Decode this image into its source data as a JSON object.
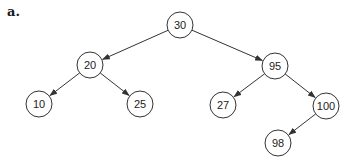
{
  "figure_label": "a.",
  "tree": {
    "type": "binary-search-tree",
    "nodes": [
      {
        "id": "n30",
        "value": "30",
        "x": 180,
        "y": 25
      },
      {
        "id": "n20",
        "value": "20",
        "x": 90,
        "y": 65
      },
      {
        "id": "n95",
        "value": "95",
        "x": 275,
        "y": 66
      },
      {
        "id": "n10",
        "value": "10",
        "x": 39,
        "y": 104
      },
      {
        "id": "n25",
        "value": "25",
        "x": 140,
        "y": 104
      },
      {
        "id": "n27",
        "value": "27",
        "x": 223,
        "y": 105
      },
      {
        "id": "n100",
        "value": "100",
        "x": 326,
        "y": 106
      },
      {
        "id": "n98",
        "value": "98",
        "x": 278,
        "y": 143
      }
    ],
    "edges": [
      {
        "from": "n30",
        "to": "n20"
      },
      {
        "from": "n30",
        "to": "n95"
      },
      {
        "from": "n20",
        "to": "n10"
      },
      {
        "from": "n20",
        "to": "n25"
      },
      {
        "from": "n95",
        "to": "n27"
      },
      {
        "from": "n95",
        "to": "n100"
      },
      {
        "from": "n100",
        "to": "n98"
      }
    ],
    "node_radius": 13,
    "stroke_color": "#333333"
  }
}
